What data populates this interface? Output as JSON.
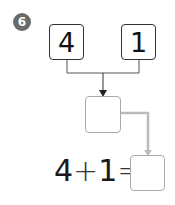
{
  "problem": {
    "number": "6",
    "top_boxes": [
      {
        "value": "4"
      },
      {
        "value": "1"
      }
    ],
    "middle_box": {
      "value": ""
    },
    "equation": {
      "operand1": "4",
      "operator": "+",
      "operand2": "1",
      "equals": "=",
      "answer": ""
    }
  },
  "colors": {
    "badge": "#6b6b6b",
    "box_border_dark": "#333333",
    "box_border_light": "#aaaaaa",
    "connector_dark": "#333333",
    "connector_light": "#bbbbbb"
  }
}
